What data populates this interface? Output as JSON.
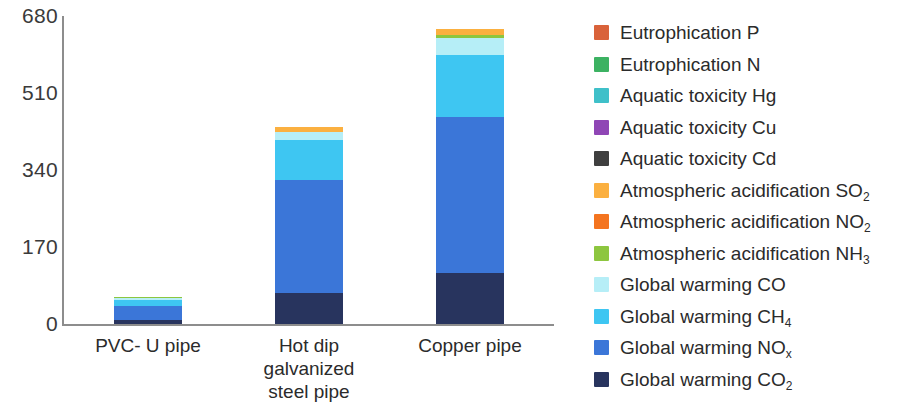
{
  "chart_data": {
    "type": "bar",
    "subtype": "stacked-bar",
    "title": "",
    "xlabel": "",
    "ylabel": "",
    "grid": false,
    "legend_position": "right",
    "ylim": [
      0,
      680
    ],
    "yticks": [
      "0",
      "170",
      "340",
      "510",
      "680"
    ],
    "ytick_values": [
      0,
      170,
      340,
      510,
      680
    ],
    "categories": [
      "PVC- U pipe",
      "Hot dip galvanized steel pipe",
      "Copper pipe"
    ],
    "category_lines": [
      [
        "PVC- U pipe"
      ],
      [
        "Hot dip",
        "galvanized",
        "steel pipe"
      ],
      [
        "Copper pipe"
      ]
    ],
    "series": [
      {
        "name": "Eutrophication P",
        "color": "#d9623a",
        "values": [
          0,
          0,
          0
        ]
      },
      {
        "name": "Eutrophication N",
        "color": "#3cb262",
        "values": [
          0,
          0,
          0
        ]
      },
      {
        "name": "Aquatic toxicity Hg",
        "color": "#3fc0c9",
        "values": [
          0,
          0,
          0
        ]
      },
      {
        "name": "Aquatic toxicity Cu",
        "color": "#8f46b5",
        "values": [
          0,
          0,
          0
        ]
      },
      {
        "name": "Aquatic toxicity Cd",
        "color": "#3f3f3f",
        "values": [
          0,
          0,
          0
        ]
      },
      {
        "name": "Atmospheric acidification SO2",
        "label_base": "Atmospheric acidification SO",
        "label_sub": "2",
        "color": "#fbb040",
        "values": [
          0,
          11,
          13
        ]
      },
      {
        "name": "Atmospheric acidification NO2",
        "label_base": "Atmospheric acidification NO",
        "label_sub": "2",
        "color": "#f4741f",
        "values": [
          0,
          0,
          0
        ]
      },
      {
        "name": "Atmospheric acidification NH3",
        "label_base": "Atmospheric acidification NH",
        "label_sub": "3",
        "color": "#8dc63f",
        "values": [
          3,
          0,
          8
        ]
      },
      {
        "name": "Global warming CO",
        "label_base": "Global warming CO",
        "label_sub": "",
        "color": "#b6eef7",
        "values": [
          4,
          18,
          38
        ]
      },
      {
        "name": "Global warming CH4",
        "label_base": "Global warming CH",
        "label_sub": "4",
        "color": "#3ec6f2",
        "values": [
          13,
          88,
          137
        ]
      },
      {
        "name": "Global warming NOx",
        "label_base": "Global warming NO",
        "label_sub": "x",
        "color": "#3b76d8",
        "values": [
          32,
          250,
          343
        ]
      },
      {
        "name": "Global warming CO2",
        "label_base": "Global warming CO",
        "label_sub": "2",
        "color": "#28345e",
        "values": [
          8,
          68,
          113
        ]
      }
    ],
    "totals": [
      60,
      435,
      652
    ]
  },
  "legend": {
    "entries": [
      {
        "label_base": "Eutrophication P",
        "label_sub": "",
        "color": "#d9623a"
      },
      {
        "label_base": "Eutrophication N",
        "label_sub": "",
        "color": "#3cb262"
      },
      {
        "label_base": "Aquatic toxicity Hg",
        "label_sub": "",
        "color": "#3fc0c9"
      },
      {
        "label_base": "Aquatic toxicity Cu",
        "label_sub": "",
        "color": "#8f46b5"
      },
      {
        "label_base": "Aquatic toxicity Cd",
        "label_sub": "",
        "color": "#3f3f3f"
      },
      {
        "label_base": "Atmospheric acidification SO",
        "label_sub": "2",
        "color": "#fbb040"
      },
      {
        "label_base": "Atmospheric acidification NO",
        "label_sub": "2",
        "color": "#f4741f"
      },
      {
        "label_base": "Atmospheric acidification NH",
        "label_sub": "3",
        "color": "#8dc63f"
      },
      {
        "label_base": "Global warming CO",
        "label_sub": "",
        "color": "#b6eef7"
      },
      {
        "label_base": "Global warming CH",
        "label_sub": "4",
        "color": "#3ec6f2"
      },
      {
        "label_base": "Global warming NO",
        "label_sub": "x",
        "color": "#3b76d8"
      },
      {
        "label_base": "Global warming CO",
        "label_sub": "2",
        "color": "#28345e"
      }
    ]
  },
  "axis_colors": {
    "line": "#8d8d8d",
    "text": "#2b2b2b"
  }
}
